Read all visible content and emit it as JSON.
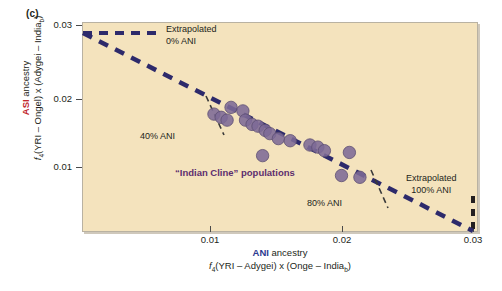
{
  "figure": {
    "panel_label": "(c)",
    "background_color": "#f4e3bd",
    "accent_asi_color": "#c1272d",
    "accent_ani_color": "#2b3a8f",
    "point_color": "#7d6a96",
    "cline_color": "#5d2e6e",
    "regression_color": "#2d2a6b"
  },
  "axes": {
    "x": {
      "label_prefix": "ANI",
      "label_suffix": " ancestry",
      "formula_pre": "f",
      "formula_sub": "4",
      "formula_post": "(YRI – Adygei) x (Onge – India",
      "formula_sub2": "b",
      "formula_end": ")",
      "ticks": [
        "0.01",
        "0.02",
        "0.03"
      ],
      "tick_values": [
        0.01,
        0.02,
        0.03
      ],
      "range": [
        0.0,
        0.0325
      ]
    },
    "y": {
      "label_prefix": "ASI",
      "label_suffix": " ancestry",
      "formula_pre": "f",
      "formula_sub": "4",
      "formula_post": "(YRI – Ongel) x (Adygei – India",
      "formula_sub2": "b",
      "formula_end": ")",
      "ticks": [
        "0.01",
        "0.02",
        "0.03"
      ],
      "tick_values": [
        0.01,
        0.02,
        0.03
      ],
      "range": [
        0.0,
        0.0322
      ]
    }
  },
  "annotations": {
    "extrapolated_0": {
      "line1": "Extrapolated",
      "line2": "0% ANI"
    },
    "extrapolated_100": {
      "line1": "Extrapolated",
      "line2": "100% ANI"
    },
    "ani_40": "40% ANI",
    "ani_80": "80% ANI",
    "cline": "“Indian Cline” populations"
  },
  "chart_data": {
    "type": "scatter",
    "title": "",
    "xlabel": "ANI ancestry  f4(YRI – Adygei) x (Onge – India_b)",
    "ylabel": "ASI ancestry  f4(YRI – Ongel) x (Adygei – India_b)",
    "xlim": [
      0.0,
      0.0325
    ],
    "ylim": [
      0.0,
      0.0322
    ],
    "grid": false,
    "legend": "none",
    "series": [
      {
        "name": "Indian Cline populations",
        "marker": "circle",
        "color": "#7d6a96",
        "points": [
          {
            "x": 0.0103,
            "y": 0.01745
          },
          {
            "x": 0.01085,
            "y": 0.017
          },
          {
            "x": 0.0113,
            "y": 0.0166
          },
          {
            "x": 0.0116,
            "y": 0.0184
          },
          {
            "x": 0.0125,
            "y": 0.0179
          },
          {
            "x": 0.0127,
            "y": 0.0166
          },
          {
            "x": 0.0132,
            "y": 0.016
          },
          {
            "x": 0.01365,
            "y": 0.01575
          },
          {
            "x": 0.0142,
            "y": 0.01515
          },
          {
            "x": 0.01455,
            "y": 0.0147
          },
          {
            "x": 0.0152,
            "y": 0.014
          },
          {
            "x": 0.014,
            "y": 0.0116
          },
          {
            "x": 0.0161,
            "y": 0.0137
          },
          {
            "x": 0.0176,
            "y": 0.0131
          },
          {
            "x": 0.0182,
            "y": 0.0128
          },
          {
            "x": 0.0187,
            "y": 0.0123
          },
          {
            "x": 0.0206,
            "y": 0.01205
          },
          {
            "x": 0.02,
            "y": 0.0088
          },
          {
            "x": 0.0214,
            "y": 0.00855
          }
        ]
      }
    ],
    "fit_line": {
      "name": "regression / admixture cline",
      "style": "dashed",
      "color": "#2d2a6b",
      "x0": 0.0,
      "y0": 0.0288,
      "x1": 0.03,
      "y1": 0.0
    },
    "reference_lines": [
      {
        "name": "Extrapolated 0% ANI",
        "orientation": "horizontal",
        "value": 0.0288,
        "style": "dashed"
      },
      {
        "name": "Extrapolated 100% ANI",
        "orientation": "vertical",
        "value": 0.03,
        "style": "dashed"
      },
      {
        "name": "40% ANI tick",
        "orientation": "oblique",
        "at_x": 0.0107,
        "style": "dashed-short"
      },
      {
        "name": "80% ANI tick",
        "orientation": "oblique",
        "at_x": 0.0213,
        "style": "dashed-short"
      }
    ]
  }
}
